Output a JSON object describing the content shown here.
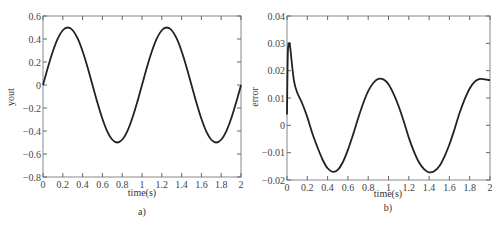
{
  "chart_data": [
    {
      "type": "line",
      "panel_label": "a)",
      "title": "",
      "xlabel": "time(s)",
      "ylabel": "yout",
      "xlim": [
        0,
        2
      ],
      "ylim": [
        -0.8,
        0.6
      ],
      "xticks": [
        0,
        0.2,
        0.4,
        0.6,
        0.8,
        1,
        1.2,
        1.4,
        1.6,
        1.8,
        2
      ],
      "xtick_labels": [
        "0",
        "0.2",
        "0.4",
        "0.6",
        "0.8",
        "1",
        "1.2",
        "1.4",
        "1.6",
        "1.8",
        "2"
      ],
      "yticks": [
        0.6,
        0.4,
        0.2,
        0,
        -0.2,
        -0.4,
        -0.6,
        -0.8
      ],
      "ytick_labels": [
        "0.6",
        "0.4",
        "0.2",
        "0",
        "−0.2",
        "−0.4",
        "−0.6",
        "−0.8"
      ],
      "grid": false,
      "legend": null,
      "series": [
        {
          "name": "yout",
          "color": "#222222",
          "x": [
            0,
            0.05,
            0.1,
            0.15,
            0.2,
            0.25,
            0.3,
            0.35,
            0.4,
            0.45,
            0.5,
            0.55,
            0.6,
            0.65,
            0.7,
            0.75,
            0.8,
            0.85,
            0.9,
            0.95,
            1.0,
            1.05,
            1.1,
            1.15,
            1.2,
            1.25,
            1.3,
            1.35,
            1.4,
            1.45,
            1.5,
            1.55,
            1.6,
            1.65,
            1.7,
            1.75,
            1.8,
            1.85,
            1.9,
            1.95,
            2.0
          ],
          "y": [
            0,
            0.155,
            0.294,
            0.405,
            0.476,
            0.5,
            0.476,
            0.405,
            0.294,
            0.155,
            0,
            -0.155,
            -0.294,
            -0.405,
            -0.476,
            -0.5,
            -0.476,
            -0.405,
            -0.294,
            -0.155,
            0,
            0.155,
            0.294,
            0.405,
            0.476,
            0.5,
            0.476,
            0.405,
            0.294,
            0.155,
            0,
            -0.155,
            -0.294,
            -0.405,
            -0.476,
            -0.5,
            -0.476,
            -0.405,
            -0.294,
            -0.155,
            0
          ]
        }
      ]
    },
    {
      "type": "line",
      "panel_label": "b)",
      "title": "",
      "xlabel": "time(s)",
      "ylabel": "error",
      "xlim": [
        0,
        2
      ],
      "ylim": [
        -0.02,
        0.04
      ],
      "xticks": [
        0,
        0.2,
        0.4,
        0.6,
        0.8,
        1,
        1.2,
        1.4,
        1.6,
        1.8,
        2
      ],
      "xtick_labels": [
        "0",
        "0.2",
        "0.4",
        "0.6",
        "0.8",
        "1",
        "1.2",
        "1.4",
        "1.6",
        "1.8",
        "2"
      ],
      "yticks": [
        0.04,
        0.03,
        0.02,
        0.01,
        0,
        -0.01,
        -0.02
      ],
      "ytick_labels": [
        "0.04",
        "0.03",
        "0.02",
        "0.01",
        "0",
        "−0.01",
        "−0.02"
      ],
      "grid": false,
      "legend": null,
      "series": [
        {
          "name": "error",
          "color": "#222222",
          "x": [
            0,
            0.005,
            0.01,
            0.02,
            0.03,
            0.05,
            0.07,
            0.1,
            0.15,
            0.2,
            0.25,
            0.3,
            0.35,
            0.4,
            0.45,
            0.5,
            0.55,
            0.6,
            0.65,
            0.7,
            0.75,
            0.8,
            0.85,
            0.9,
            0.95,
            1.0,
            1.05,
            1.1,
            1.15,
            1.2,
            1.25,
            1.3,
            1.35,
            1.4,
            1.45,
            1.5,
            1.55,
            1.6,
            1.65,
            1.7,
            1.75,
            1.8,
            1.85,
            1.9,
            1.95,
            2.0
          ],
          "y": [
            0.004,
            0.02,
            0.028,
            0.03,
            0.029,
            0.022,
            0.016,
            0.012,
            0.008,
            0.003,
            -0.003,
            -0.008,
            -0.0125,
            -0.0157,
            -0.017,
            -0.0163,
            -0.0135,
            -0.009,
            -0.0035,
            0.0025,
            0.008,
            0.0125,
            0.0155,
            0.017,
            0.0168,
            0.015,
            0.0115,
            0.007,
            0.0015,
            -0.0045,
            -0.0095,
            -0.0135,
            -0.016,
            -0.0172,
            -0.0168,
            -0.015,
            -0.0115,
            -0.007,
            -0.0015,
            0.0045,
            0.0095,
            0.0135,
            0.016,
            0.017,
            0.0168,
            0.0165
          ]
        }
      ]
    }
  ],
  "panels": [
    {
      "xlabel": "time(s)",
      "ylabel": "yout",
      "caption": "a)"
    },
    {
      "xlabel": "time(s)",
      "ylabel": "error",
      "caption": "b)"
    }
  ]
}
